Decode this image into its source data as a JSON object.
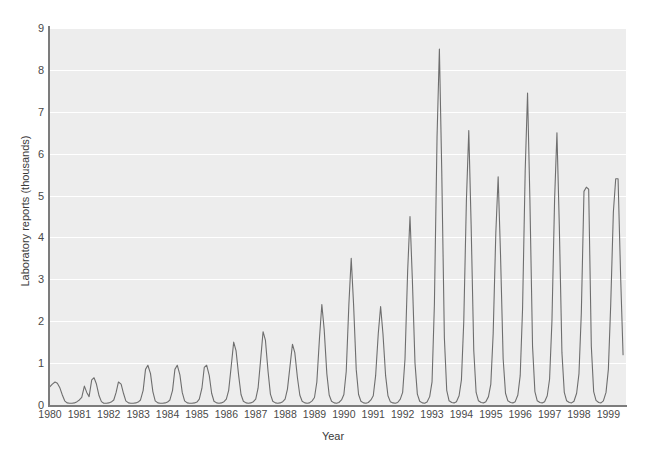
{
  "chart_data": {
    "type": "line",
    "title": "",
    "subtitle": "",
    "xlabel": "Year",
    "ylabel": "Laboratory reports (thousands)",
    "xlim": [
      1980,
      1999.6
    ],
    "ylim": [
      0,
      9
    ],
    "grid": true,
    "legend": null,
    "y_ticks": [
      0,
      1,
      2,
      3,
      4,
      5,
      6,
      7,
      8,
      9
    ],
    "y_tick_labels": [
      "0",
      "1",
      "2",
      "3",
      "4",
      "5",
      "6",
      "7",
      "8",
      "9"
    ],
    "x_ticks": [
      1980,
      1981,
      1982,
      1983,
      1984,
      1985,
      1986,
      1987,
      1988,
      1989,
      1990,
      1991,
      1992,
      1993,
      1994,
      1995,
      1996,
      1997,
      1998,
      1999
    ],
    "x_tick_labels": [
      "1980",
      "1981",
      "1982",
      "1983",
      "1984",
      "1985",
      "1986",
      "1987",
      "1988",
      "1989",
      "1990",
      "1991",
      "1992",
      "1993",
      "1994",
      "1995",
      "1996",
      "1997",
      "1998",
      "1999"
    ],
    "line_color": "#6e6e6e",
    "plot_background": "#ededed",
    "gridline_color": "#ffffff",
    "annual_peak_values": [
      0.55,
      0.65,
      0.55,
      0.95,
      0.95,
      0.95,
      1.5,
      1.75,
      1.45,
      2.4,
      3.5,
      2.35,
      4.5,
      8.5,
      6.55,
      5.45,
      7.45,
      6.5,
      5.2,
      5.4
    ],
    "annual_peak_years": [
      1980,
      1981,
      1982,
      1983,
      1984,
      1985,
      1986,
      1987,
      1988,
      1989,
      1990,
      1991,
      1992,
      1993,
      1994,
      1995,
      1996,
      1997,
      1998,
      1999
    ],
    "series": [
      {
        "name": "Laboratory reports",
        "x": [
          1980.0,
          1980.08,
          1980.17,
          1980.25,
          1980.33,
          1980.42,
          1980.5,
          1980.58,
          1980.67,
          1980.75,
          1980.83,
          1980.92,
          1981.0,
          1981.08,
          1981.17,
          1981.25,
          1981.33,
          1981.42,
          1981.5,
          1981.58,
          1981.67,
          1981.75,
          1981.83,
          1981.92,
          1982.0,
          1982.08,
          1982.17,
          1982.25,
          1982.33,
          1982.42,
          1982.5,
          1982.58,
          1982.67,
          1982.75,
          1982.83,
          1982.92,
          1983.0,
          1983.08,
          1983.17,
          1983.25,
          1983.33,
          1983.42,
          1983.5,
          1983.58,
          1983.67,
          1983.75,
          1983.83,
          1983.92,
          1984.0,
          1984.08,
          1984.17,
          1984.25,
          1984.33,
          1984.42,
          1984.5,
          1984.58,
          1984.67,
          1984.75,
          1984.83,
          1984.92,
          1985.0,
          1985.08,
          1985.17,
          1985.25,
          1985.33,
          1985.42,
          1985.5,
          1985.58,
          1985.67,
          1985.75,
          1985.83,
          1985.92,
          1986.0,
          1986.08,
          1986.17,
          1986.25,
          1986.33,
          1986.42,
          1986.5,
          1986.58,
          1986.67,
          1986.75,
          1986.83,
          1986.92,
          1987.0,
          1987.08,
          1987.17,
          1987.25,
          1987.33,
          1987.42,
          1987.5,
          1987.58,
          1987.67,
          1987.75,
          1987.83,
          1987.92,
          1988.0,
          1988.08,
          1988.17,
          1988.25,
          1988.33,
          1988.42,
          1988.5,
          1988.58,
          1988.67,
          1988.75,
          1988.83,
          1988.92,
          1989.0,
          1989.08,
          1989.17,
          1989.25,
          1989.33,
          1989.42,
          1989.5,
          1989.58,
          1989.67,
          1989.75,
          1989.83,
          1989.92,
          1990.0,
          1990.08,
          1990.17,
          1990.25,
          1990.33,
          1990.42,
          1990.5,
          1990.58,
          1990.67,
          1990.75,
          1990.83,
          1990.92,
          1991.0,
          1991.08,
          1991.17,
          1991.25,
          1991.33,
          1991.42,
          1991.5,
          1991.58,
          1991.67,
          1991.75,
          1991.83,
          1991.92,
          1992.0,
          1992.08,
          1992.17,
          1992.25,
          1992.33,
          1992.42,
          1992.5,
          1992.58,
          1992.67,
          1992.75,
          1992.83,
          1992.92,
          1993.0,
          1993.08,
          1993.17,
          1993.25,
          1993.33,
          1993.42,
          1993.5,
          1993.58,
          1993.67,
          1993.75,
          1993.83,
          1993.92,
          1994.0,
          1994.08,
          1994.17,
          1994.25,
          1994.33,
          1994.42,
          1994.5,
          1994.58,
          1994.67,
          1994.75,
          1994.83,
          1994.92,
          1995.0,
          1995.08,
          1995.17,
          1995.25,
          1995.33,
          1995.42,
          1995.5,
          1995.58,
          1995.67,
          1995.75,
          1995.83,
          1995.92,
          1996.0,
          1996.08,
          1996.17,
          1996.25,
          1996.33,
          1996.42,
          1996.5,
          1996.58,
          1996.67,
          1996.75,
          1996.83,
          1996.92,
          1997.0,
          1997.08,
          1997.17,
          1997.25,
          1997.33,
          1997.42,
          1997.5,
          1997.58,
          1997.67,
          1997.75,
          1997.83,
          1997.92,
          1998.0,
          1998.08,
          1998.17,
          1998.25,
          1998.33,
          1998.42,
          1998.5,
          1998.58,
          1998.67,
          1998.75,
          1998.83,
          1998.92,
          1999.0,
          1999.08,
          1999.17,
          1999.25,
          1999.33,
          1999.42,
          1999.5
        ],
        "y": [
          0.44,
          0.5,
          0.55,
          0.52,
          0.42,
          0.24,
          0.1,
          0.05,
          0.04,
          0.04,
          0.05,
          0.08,
          0.12,
          0.18,
          0.45,
          0.3,
          0.2,
          0.6,
          0.65,
          0.5,
          0.22,
          0.08,
          0.04,
          0.04,
          0.05,
          0.07,
          0.12,
          0.3,
          0.55,
          0.5,
          0.28,
          0.1,
          0.05,
          0.04,
          0.04,
          0.05,
          0.07,
          0.12,
          0.35,
          0.85,
          0.95,
          0.75,
          0.32,
          0.1,
          0.05,
          0.04,
          0.04,
          0.05,
          0.07,
          0.12,
          0.35,
          0.85,
          0.95,
          0.72,
          0.3,
          0.1,
          0.05,
          0.04,
          0.04,
          0.05,
          0.07,
          0.14,
          0.4,
          0.9,
          0.95,
          0.7,
          0.28,
          0.09,
          0.05,
          0.04,
          0.05,
          0.08,
          0.14,
          0.35,
          0.95,
          1.5,
          1.3,
          0.7,
          0.25,
          0.09,
          0.05,
          0.04,
          0.05,
          0.08,
          0.14,
          0.4,
          1.1,
          1.75,
          1.55,
          0.8,
          0.26,
          0.09,
          0.05,
          0.04,
          0.05,
          0.08,
          0.14,
          0.38,
          0.95,
          1.45,
          1.25,
          0.65,
          0.24,
          0.09,
          0.05,
          0.04,
          0.05,
          0.1,
          0.18,
          0.55,
          1.6,
          2.4,
          1.8,
          0.75,
          0.24,
          0.09,
          0.05,
          0.04,
          0.06,
          0.12,
          0.25,
          0.8,
          2.4,
          3.5,
          2.4,
          0.85,
          0.25,
          0.09,
          0.05,
          0.04,
          0.06,
          0.12,
          0.22,
          0.7,
          1.7,
          2.35,
          1.7,
          0.7,
          0.22,
          0.08,
          0.05,
          0.04,
          0.06,
          0.14,
          0.3,
          1.1,
          3.2,
          4.5,
          3.0,
          1.0,
          0.26,
          0.09,
          0.05,
          0.04,
          0.07,
          0.2,
          0.55,
          2.4,
          6.4,
          8.5,
          5.6,
          1.6,
          0.35,
          0.1,
          0.06,
          0.05,
          0.08,
          0.22,
          0.6,
          2.0,
          4.9,
          6.55,
          4.3,
          1.3,
          0.3,
          0.1,
          0.06,
          0.05,
          0.08,
          0.2,
          0.5,
          1.7,
          4.1,
          5.45,
          3.6,
          1.1,
          0.28,
          0.1,
          0.06,
          0.05,
          0.08,
          0.24,
          0.7,
          2.3,
          5.6,
          7.45,
          4.9,
          1.4,
          0.32,
          0.1,
          0.06,
          0.05,
          0.08,
          0.22,
          0.62,
          2.0,
          4.9,
          6.5,
          4.3,
          1.25,
          0.3,
          0.1,
          0.06,
          0.05,
          0.09,
          0.28,
          0.75,
          2.2,
          5.1,
          5.2,
          5.15,
          1.4,
          0.32,
          0.11,
          0.06,
          0.05,
          0.1,
          0.3,
          0.85,
          2.4,
          4.6,
          5.4,
          5.4,
          3.0,
          1.2
        ]
      }
    ]
  }
}
